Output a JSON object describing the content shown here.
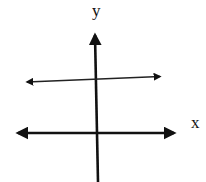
{
  "diagram": {
    "type": "coordinate-axes-with-line",
    "labels": {
      "y_axis": "y",
      "x_axis": "x"
    },
    "elements": [
      {
        "name": "x-axis",
        "kind": "double-arrow line",
        "from": [
          16,
          133
        ],
        "to": [
          176,
          133
        ]
      },
      {
        "name": "y-axis",
        "kind": "single-arrow line (up)",
        "from": [
          98,
          182
        ],
        "to": [
          95,
          33
        ]
      },
      {
        "name": "horizontal-line",
        "kind": "double-arrow line",
        "from": [
          25,
          82
        ],
        "to": [
          162,
          76
        ]
      }
    ],
    "colors": {
      "stroke": "#111111",
      "background": "#ffffff"
    }
  }
}
